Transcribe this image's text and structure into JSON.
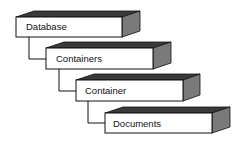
{
  "diagram": {
    "type": "hierarchy",
    "colors": {
      "front": "#ffffff",
      "top": "#3a3a3a",
      "side": "#7a7a7a",
      "stroke": "#111111",
      "connector": "#111111"
    },
    "nodes": [
      {
        "id": "database",
        "label": "Database",
        "level": 0
      },
      {
        "id": "containers",
        "label": "Containers",
        "level": 1
      },
      {
        "id": "container",
        "label": "Container",
        "level": 2
      },
      {
        "id": "documents",
        "label": "Documents",
        "level": 3
      }
    ],
    "edges": [
      {
        "from": "database",
        "to": "containers"
      },
      {
        "from": "containers",
        "to": "container"
      },
      {
        "from": "container",
        "to": "documents"
      }
    ]
  }
}
